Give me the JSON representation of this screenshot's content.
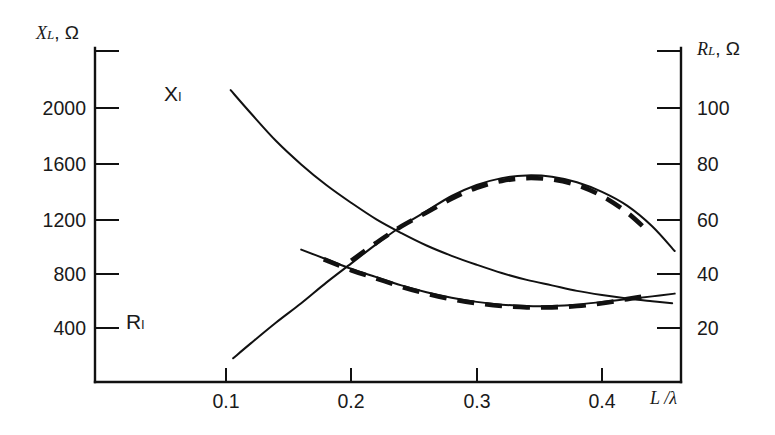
{
  "chart_data": {
    "type": "line",
    "title": "",
    "xlabel": "L /λ",
    "ylabel_left": "X_L, Ω",
    "ylabel_right": "R_L, Ω",
    "grid": false,
    "legend_position": "inline-curve-labels",
    "xlim": [
      0.095,
      0.46
    ],
    "xticks": [
      0.1,
      0.2,
      0.3,
      0.4
    ],
    "xticklabels": [
      "0.1",
      "0.2",
      "0.3",
      "0.4"
    ],
    "ylim_left": [
      0,
      2400
    ],
    "yticks_left": [
      400,
      800,
      1200,
      1600,
      2000,
      2400
    ],
    "yticklabels_left": [
      "400",
      "800",
      "1200",
      "1600",
      "2000",
      ""
    ],
    "ylim_right": [
      0,
      120
    ],
    "yticks_right": [
      20,
      40,
      60,
      80,
      100,
      120
    ],
    "yticklabels_right": [
      "20",
      "40",
      "60",
      "80",
      "100",
      ""
    ],
    "series": [
      {
        "name": "X_L",
        "label": "Xₗ",
        "style": "solid",
        "axis": "left",
        "x": [
          0.1037,
          0.12,
          0.14,
          0.16,
          0.18,
          0.2,
          0.22,
          0.24,
          0.26,
          0.28,
          0.3,
          0.32,
          0.34,
          0.36,
          0.38,
          0.4,
          0.42,
          0.44,
          0.456
        ],
        "y": [
          2130,
          1960,
          1760,
          1590,
          1440,
          1310,
          1190,
          1090,
          1000,
          925,
          860,
          800,
          750,
          710,
          670,
          640,
          615,
          595,
          580
        ]
      },
      {
        "name": "R_L_solid",
        "label": "Rₗ",
        "style": "solid",
        "axis": "right",
        "x": [
          0.1057,
          0.12,
          0.14,
          0.16,
          0.18,
          0.2,
          0.22,
          0.24,
          0.26,
          0.28,
          0.3,
          0.32,
          0.34,
          0.36,
          0.38,
          0.4,
          0.42,
          0.44,
          0.458
        ],
        "y": [
          9.0,
          14.5,
          22.0,
          29.0,
          36.5,
          43.5,
          50.5,
          57.0,
          62.5,
          68.0,
          72.0,
          74.5,
          75.5,
          75.0,
          73.0,
          69.5,
          64.5,
          57.0,
          48.0
        ]
      },
      {
        "name": "R_L_lower_solid",
        "label": "",
        "style": "solid",
        "axis": "right",
        "x": [
          0.16,
          0.18,
          0.2,
          0.22,
          0.24,
          0.26,
          0.28,
          0.3,
          0.32,
          0.34,
          0.36,
          0.38,
          0.4,
          0.42,
          0.44,
          0.458
        ],
        "y": [
          48.5,
          45.0,
          41.5,
          38.5,
          35.5,
          33.0,
          31.0,
          29.5,
          28.5,
          28.0,
          28.0,
          28.5,
          29.5,
          30.5,
          31.5,
          32.5
        ]
      },
      {
        "name": "upper_dashed",
        "label": "",
        "style": "dashed",
        "axis": "right",
        "x": [
          0.2,
          0.22,
          0.24,
          0.26,
          0.28,
          0.3,
          0.32,
          0.34,
          0.36,
          0.38,
          0.4,
          0.42,
          0.436
        ],
        "y": [
          44.5,
          51.0,
          57.0,
          62.0,
          67.0,
          71.0,
          73.5,
          74.5,
          74.0,
          72.0,
          68.0,
          62.0,
          55.5
        ]
      },
      {
        "name": "lower_dashed",
        "label": "",
        "style": "dashed",
        "axis": "right",
        "x": [
          0.178,
          0.2,
          0.22,
          0.24,
          0.26,
          0.28,
          0.3,
          0.32,
          0.34,
          0.36,
          0.38,
          0.4,
          0.42,
          0.44
        ],
        "y": [
          45.0,
          41.0,
          38.0,
          35.0,
          32.5,
          30.5,
          29.0,
          28.0,
          27.5,
          27.5,
          28.0,
          29.0,
          30.5,
          32.0
        ]
      }
    ],
    "annotations": [
      {
        "text": "Xₗ",
        "x": 0.133,
        "y_px": 93,
        "series": "X_L"
      },
      {
        "text": "Rₗ",
        "x": 0.108,
        "y_px": 325,
        "series": "R_L"
      }
    ]
  },
  "axes": {
    "left": {
      "title_symbol": "X",
      "title_subscript": "L",
      "title_unit": ", Ω",
      "ticklabels": [
        "2000",
        "1600",
        "1200",
        "800",
        "400"
      ]
    },
    "right": {
      "title_symbol": "R",
      "title_subscript": "L",
      "title_unit": ", Ω",
      "ticklabels": [
        "100",
        "80",
        "60",
        "40",
        "20"
      ]
    },
    "bottom": {
      "title": "L /λ",
      "ticklabels": [
        "0.1",
        "0.2",
        "0.3",
        "0.4"
      ]
    }
  },
  "colors": {
    "ink": "#111111",
    "background": "#ffffff"
  }
}
